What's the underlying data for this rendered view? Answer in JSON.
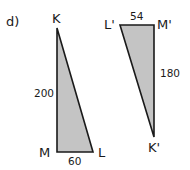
{
  "problem_label": "d)",
  "colors": {
    "fill": "#c4c4c4",
    "stroke": "#1a1a1a"
  },
  "triangle_kml": {
    "vertices": {
      "top": "K",
      "bottom_left": "M",
      "bottom_right": "L"
    },
    "sides": {
      "KM": "200",
      "ML": "60"
    }
  },
  "triangle_klm_prime": {
    "vertices": {
      "top_left": "L'",
      "top_right": "M'",
      "bottom": "K'"
    },
    "sides": {
      "LM": "54",
      "MK": "180"
    }
  }
}
